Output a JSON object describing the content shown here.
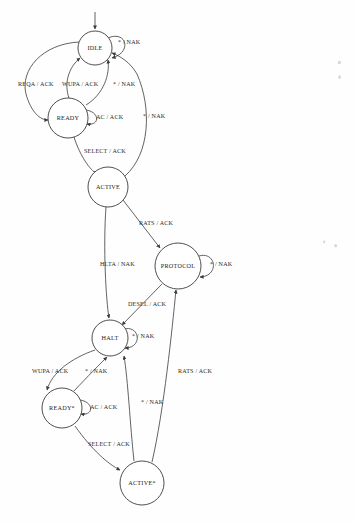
{
  "diagram": {
    "type": "finite-state-machine",
    "colors": {
      "stroke": "#3b3b3b",
      "text": "#1b1b1b",
      "background": "#fefefe"
    },
    "states": [
      {
        "id": "idle",
        "label": "IDLE",
        "cx": 95,
        "cy": 48,
        "r": 17
      },
      {
        "id": "ready",
        "label": "READY",
        "cx": 68,
        "cy": 118,
        "r": 20
      },
      {
        "id": "active",
        "label": "ACTIVE",
        "cx": 108,
        "cy": 187,
        "r": 20
      },
      {
        "id": "protocol",
        "label": "PROTOCOL",
        "cx": 178,
        "cy": 266,
        "r": 23
      },
      {
        "id": "halt",
        "label": "HALT",
        "cx": 110,
        "cy": 338,
        "r": 18
      },
      {
        "id": "ready_st",
        "label": "READY*",
        "cx": 62,
        "cy": 408,
        "r": 20
      },
      {
        "id": "active_st",
        "label": "ACTIVE*",
        "cx": 142,
        "cy": 483,
        "r": 22
      }
    ],
    "start": {
      "label": "",
      "from_x": 95,
      "from_y": 12,
      "to_x": 95,
      "to_y": 30
    },
    "transitions": [
      {
        "id": "idle-self",
        "label": "* / NAK",
        "from": "idle",
        "to": "idle",
        "lx": 118,
        "ly": 43
      },
      {
        "id": "idle-ready-reqa",
        "label": "REQA / ACK",
        "from": "idle",
        "to": "ready",
        "lx": 18,
        "ly": 85
      },
      {
        "id": "ready-idle-wupa",
        "label": "WUPA / ACK",
        "from": "ready",
        "to": "idle",
        "lx": 62,
        "ly": 85
      },
      {
        "id": "ready-idle-nak",
        "label": "* / NAK",
        "from": "ready",
        "to": "idle",
        "lx": 113,
        "ly": 85
      },
      {
        "id": "ready-self-ac",
        "label": "AC / ACK",
        "from": "ready",
        "to": "ready",
        "lx": 96,
        "ly": 118
      },
      {
        "id": "ready-active-select",
        "label": "SELECT / ACK",
        "from": "ready",
        "to": "active",
        "lx": 84,
        "ly": 152
      },
      {
        "id": "active-idle-nak",
        "label": "* / NAK",
        "from": "active",
        "to": "idle",
        "lx": 143,
        "ly": 117
      },
      {
        "id": "active-protocol-rats",
        "label": "RATS / ACK",
        "from": "active",
        "to": "protocol",
        "lx": 139,
        "ly": 224
      },
      {
        "id": "protocol-self-nak",
        "label": "* / NAK",
        "from": "protocol",
        "to": "protocol",
        "lx": 210,
        "ly": 265
      },
      {
        "id": "active-halt-hlta",
        "label": "HLTA / NAK",
        "from": "active",
        "to": "halt",
        "lx": 100,
        "ly": 265
      },
      {
        "id": "protocol-halt-desel",
        "label": "DESEL / ACK",
        "from": "protocol",
        "to": "halt",
        "lx": 128,
        "ly": 305
      },
      {
        "id": "halt-self-nak",
        "label": "* / NAK",
        "from": "halt",
        "to": "halt",
        "lx": 132,
        "ly": 337
      },
      {
        "id": "halt-ready-wupa",
        "label": "WUPA / ACK",
        "from": "halt",
        "to": "ready_st",
        "lx": 32,
        "ly": 372
      },
      {
        "id": "ready-halt-nak",
        "label": "* / NAK",
        "from": "ready_st",
        "to": "halt",
        "lx": 85,
        "ly": 372
      },
      {
        "id": "ready-self-ac2",
        "label": "AC / ACK",
        "from": "ready_st",
        "to": "ready_st",
        "lx": 90,
        "ly": 408
      },
      {
        "id": "ready-active-select2",
        "label": "SELECT / ACK",
        "from": "ready_st",
        "to": "active_st",
        "lx": 88,
        "ly": 445
      },
      {
        "id": "active-halt-nak",
        "label": "* / NAK",
        "from": "active_st",
        "to": "halt",
        "lx": 141,
        "ly": 403
      },
      {
        "id": "active-protocol-rats2",
        "label": "RATS / ACK",
        "from": "active_st",
        "to": "protocol",
        "lx": 178,
        "ly": 372
      }
    ]
  }
}
